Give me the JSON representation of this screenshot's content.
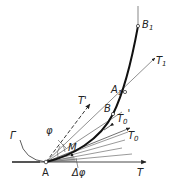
{
  "diagram": {
    "colors": {
      "stroke": "#222222",
      "thin": "#555555",
      "shade": "#bbbbbb",
      "background": "#ffffff"
    },
    "labels": {
      "gamma": "Γ",
      "phi": "φ",
      "t_prime": "T'",
      "m": "M",
      "a": "A",
      "delta_phi": "Δφ",
      "t": "T",
      "b": "B",
      "t0_prime_main": "T",
      "t0_prime_sub": "0",
      "t0_prime_mark": "'",
      "t0_main": "T",
      "t0_sub": "0",
      "a1_main": "A",
      "a1_sub": "1",
      "t1_main": "T",
      "t1_sub": "1",
      "b1_main": "B",
      "b1_sub": "1"
    }
  }
}
